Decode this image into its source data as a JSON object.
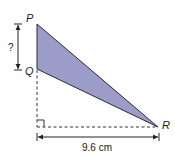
{
  "diagram": {
    "type": "geometry-triangle",
    "vertices": {
      "P": {
        "label": "P",
        "x": 37,
        "y": 24
      },
      "Q": {
        "label": "Q",
        "x": 37,
        "y": 69
      },
      "R": {
        "label": "R",
        "x": 158,
        "y": 127
      }
    },
    "triangle_fill": "#9c9cc9",
    "stroke_color": "#2a2a3a",
    "dimensions": {
      "vertical": {
        "label": "?",
        "from": "P",
        "to": "Q"
      },
      "horizontal": {
        "label": "9.6 cm"
      }
    },
    "right_angle_marker": true
  }
}
